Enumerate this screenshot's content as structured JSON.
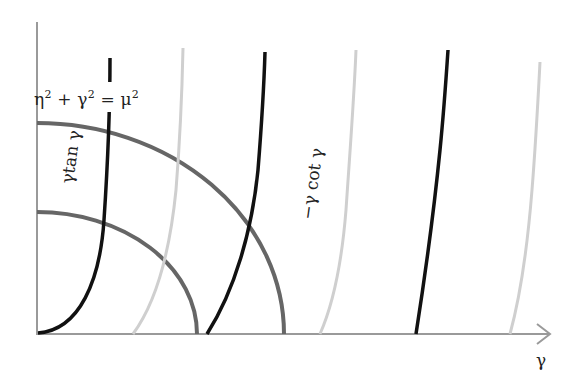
{
  "diagram": {
    "title": "",
    "equation_label": {
      "eta": "η",
      "plus": " + ",
      "gamma": "γ",
      "equals": " = ",
      "mu": "μ",
      "exp": "2"
    },
    "curve_label_tan": "γtan γ",
    "curve_label_cot": "−γ cot γ",
    "x_axis_label": "γ",
    "colors": {
      "circle": "#666666",
      "tan_curve": "#111111",
      "cot_curve": "#cfcfcf",
      "axis": "#9a9a9a"
    },
    "elements": {
      "axes": {
        "origin": [
          37,
          334
        ],
        "y_top": 22,
        "x_end": 550
      },
      "circles": [
        {
          "name": "large-circle",
          "radius_px": 247
        },
        {
          "name": "small-circle",
          "radius_px": 160
        }
      ],
      "tan_curves": 3,
      "cot_curves": 3
    }
  }
}
